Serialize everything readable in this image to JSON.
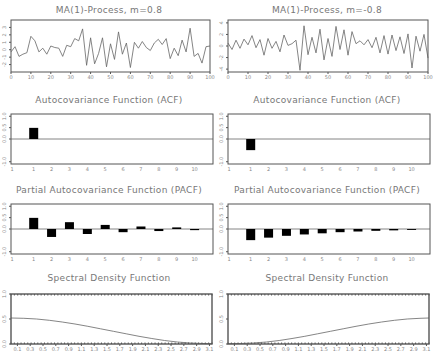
{
  "panels": {
    "ts_left": {
      "title": "MA(1)-Process, m=0.8"
    },
    "ts_right": {
      "title": "MA(1)-Process, m=-0.8"
    },
    "acf_left": {
      "title": "Autocovariance Function (ACF)"
    },
    "acf_right": {
      "title": "Autocovariance Function (ACF)"
    },
    "pacf_left": {
      "title": "Partial Autocovariance Function (PACF)"
    },
    "pacf_right": {
      "title": "Partial Autocovariance Function (PACF)"
    },
    "sdf_left": {
      "title": "Spectral Density Function"
    },
    "sdf_right": {
      "title": "Spectral Density Function"
    }
  },
  "chart_data": [
    {
      "type": "line",
      "id": "ts_left",
      "title": "MA(1)-Process, m=0.8",
      "xlabel": "",
      "ylabel": "",
      "xlim": [
        0,
        100
      ],
      "ylim": [
        -3,
        4
      ],
      "xticks": [
        0,
        10,
        20,
        30,
        40,
        50,
        60,
        70,
        80,
        90,
        100
      ],
      "yticks": [
        -2,
        -1,
        0,
        1,
        2,
        3
      ],
      "x": [
        0,
        2,
        4,
        6,
        8,
        10,
        12,
        14,
        16,
        18,
        20,
        22,
        24,
        26,
        28,
        30,
        32,
        34,
        36,
        38,
        40,
        42,
        44,
        46,
        48,
        50,
        52,
        54,
        56,
        58,
        60,
        62,
        64,
        66,
        68,
        70,
        72,
        74,
        76,
        78,
        80,
        82,
        84,
        86,
        88,
        90,
        92,
        94,
        96,
        98,
        100
      ],
      "values": [
        -0.3,
        0.4,
        -0.9,
        -0.6,
        -0.4,
        1.8,
        1.2,
        -0.3,
        0.2,
        -0.6,
        0.5,
        0.3,
        0.2,
        -0.9,
        0.6,
        0.4,
        1.5,
        1.2,
        2.8,
        -2.1,
        1.6,
        -1.9,
        -0.5,
        1.6,
        -2.3,
        0.8,
        -1.3,
        2.4,
        -0.6,
        0.9,
        -2.4,
        1.0,
        0.2,
        1.1,
        0.3,
        -0.1,
        0.9,
        1.4,
        0.7,
        1.5,
        -1.2,
        0.2,
        -0.8,
        1.3,
        -0.3,
        2.9,
        -0.9,
        -0.5,
        -1.8,
        0.4,
        0.5
      ]
    },
    {
      "type": "line",
      "id": "ts_right",
      "title": "MA(1)-Process, m=-0.8",
      "xlabel": "",
      "ylabel": "",
      "xlim": [
        0,
        100
      ],
      "ylim": [
        -4.5,
        4.5
      ],
      "xticks": [
        0,
        10,
        20,
        30,
        40,
        50,
        60,
        70,
        80,
        90,
        100
      ],
      "yticks": [
        -4,
        -2,
        0,
        2,
        4
      ],
      "x": [
        0,
        2,
        4,
        6,
        8,
        10,
        12,
        14,
        16,
        18,
        20,
        22,
        24,
        26,
        28,
        30,
        32,
        34,
        36,
        38,
        40,
        42,
        44,
        46,
        48,
        50,
        52,
        54,
        56,
        58,
        60,
        62,
        64,
        66,
        68,
        70,
        72,
        74,
        76,
        78,
        80,
        82,
        84,
        86,
        88,
        90,
        92,
        94,
        96,
        98,
        100
      ],
      "values": [
        0.5,
        -0.6,
        1.0,
        -0.4,
        1.2,
        0.2,
        1.8,
        -0.3,
        1.1,
        -1.6,
        1.3,
        -0.4,
        0.8,
        -1.0,
        1.9,
        0.1,
        0.4,
        1.0,
        -4.2,
        3.5,
        -1.5,
        1.5,
        -1.2,
        2.9,
        -2.4,
        1.3,
        -1.8,
        3.4,
        -0.6,
        2.8,
        -1.6,
        2.5,
        0.4,
        0.9,
        0.2,
        1.1,
        -0.3,
        1.5,
        -1.2,
        1.8,
        -1.4,
        1.9,
        -0.8,
        1.6,
        -1.3,
        2.1,
        -3.8,
        1.7,
        -0.9,
        2.0,
        -2.1
      ]
    },
    {
      "type": "bar",
      "id": "acf_left",
      "title": "Autocovariance Function (ACF)",
      "categories": [
        1,
        2,
        3,
        4,
        5,
        6,
        7,
        8,
        9,
        10
      ],
      "values": [
        0.49,
        0,
        0,
        0,
        0,
        0,
        0,
        0,
        0,
        0
      ],
      "ylim": [
        -1.1,
        1.1
      ],
      "yticks": [
        -1.0,
        0.0,
        0.5,
        1.0
      ],
      "xticks": [
        1,
        2,
        3,
        4,
        5,
        6,
        7,
        8,
        9,
        10
      ]
    },
    {
      "type": "bar",
      "id": "acf_right",
      "title": "Autocovariance Function (ACF)",
      "categories": [
        1,
        2,
        3,
        4,
        5,
        6,
        7,
        8,
        9,
        10
      ],
      "values": [
        -0.49,
        0,
        0,
        0,
        0,
        0,
        0,
        0,
        0,
        0
      ],
      "ylim": [
        -1.1,
        1.1
      ],
      "yticks": [
        -1.0,
        0.0,
        0.5,
        1.0
      ],
      "xticks": [
        1,
        2,
        3,
        4,
        5,
        6,
        7,
        8,
        9,
        10
      ]
    },
    {
      "type": "bar",
      "id": "pacf_left",
      "title": "Partial Autocovariance Function (PACF)",
      "categories": [
        1,
        2,
        3,
        4,
        5,
        6,
        7,
        8,
        9,
        10
      ],
      "values": [
        0.49,
        -0.35,
        0.3,
        -0.22,
        0.18,
        -0.14,
        0.11,
        -0.09,
        0.07,
        -0.05
      ],
      "ylim": [
        -1.1,
        1.1
      ],
      "yticks": [
        -1.0,
        0.0,
        0.5,
        1.0
      ],
      "xticks": [
        1,
        2,
        3,
        4,
        5,
        6,
        7,
        8,
        9,
        10
      ]
    },
    {
      "type": "bar",
      "id": "pacf_right",
      "title": "Partial Autocovariance Function (PACF)",
      "categories": [
        1,
        2,
        3,
        4,
        5,
        6,
        7,
        8,
        9,
        10
      ],
      "values": [
        -0.49,
        -0.38,
        -0.3,
        -0.24,
        -0.19,
        -0.14,
        -0.11,
        -0.08,
        -0.06,
        -0.04
      ],
      "ylim": [
        -1.1,
        1.1
      ],
      "yticks": [
        -1.0,
        0.0,
        0.5,
        1.0
      ],
      "xticks": [
        1,
        2,
        3,
        4,
        5,
        6,
        7,
        8,
        9,
        10
      ]
    },
    {
      "type": "line",
      "id": "sdf_left",
      "title": "Spectral Density Function",
      "xlim": [
        0,
        3.14
      ],
      "ylim": [
        0,
        1.0
      ],
      "yticks": [
        0.0,
        0.5,
        1.0
      ],
      "xticks": [
        0.1,
        0.3,
        0.5,
        0.7,
        0.9,
        1.1,
        1.3,
        1.5,
        1.7,
        1.9,
        2.1,
        2.3,
        2.5,
        2.7,
        2.9,
        3.1
      ],
      "x": [
        0,
        0.2,
        0.4,
        0.6,
        0.8,
        1.0,
        1.2,
        1.4,
        1.6,
        1.8,
        2.0,
        2.2,
        2.4,
        2.6,
        2.8,
        3.0,
        3.14
      ],
      "values": [
        0.52,
        0.515,
        0.5,
        0.475,
        0.44,
        0.4,
        0.355,
        0.305,
        0.255,
        0.205,
        0.155,
        0.11,
        0.07,
        0.04,
        0.02,
        0.01,
        0.007
      ]
    },
    {
      "type": "line",
      "id": "sdf_right",
      "title": "Spectral Density Function",
      "xlim": [
        0,
        3.14
      ],
      "ylim": [
        0,
        1.0
      ],
      "yticks": [
        0.0,
        0.5,
        1.0
      ],
      "xticks": [
        0.1,
        0.3,
        0.5,
        0.7,
        0.9,
        1.1,
        1.3,
        1.5,
        1.7,
        1.9,
        2.1,
        2.3,
        2.5,
        2.7,
        2.9,
        3.1
      ],
      "x": [
        0,
        0.2,
        0.4,
        0.6,
        0.8,
        1.0,
        1.2,
        1.4,
        1.6,
        1.8,
        2.0,
        2.2,
        2.4,
        2.6,
        2.8,
        3.0,
        3.14
      ],
      "values": [
        0.007,
        0.01,
        0.02,
        0.04,
        0.07,
        0.11,
        0.155,
        0.205,
        0.255,
        0.305,
        0.355,
        0.4,
        0.44,
        0.475,
        0.5,
        0.515,
        0.52
      ]
    }
  ]
}
